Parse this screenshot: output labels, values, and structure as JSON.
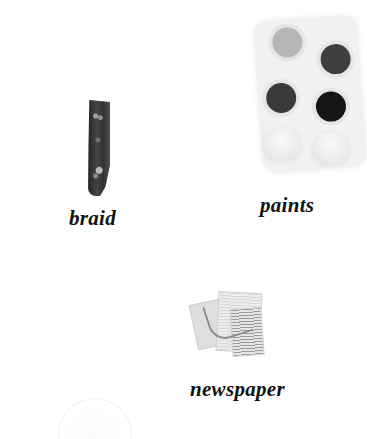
{
  "items": [
    {
      "id": "braid",
      "label": "braid",
      "image": "braid-image"
    },
    {
      "id": "paints",
      "label": "paints",
      "image": "paint-palette-image"
    },
    {
      "id": "newspaper",
      "label": "newspaper",
      "image": "crumpled-newspaper-image"
    }
  ],
  "colors": {
    "background": "#ffffff",
    "label_text": "#111111"
  }
}
